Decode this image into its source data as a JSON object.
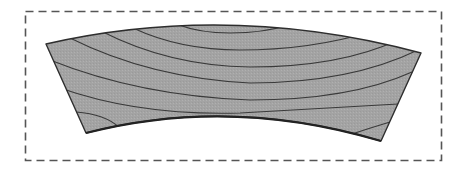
{
  "diagram": {
    "colors": {
      "background": "#ffffff",
      "frame": "#555555",
      "board_fill": "#a3a3a3",
      "board_outline": "#2e2e2e",
      "ring_line": "#3a3a3a"
    },
    "frame": {
      "style": "dashed",
      "x": 25,
      "y": 11,
      "width": 416,
      "height": 149
    },
    "board": {
      "corners": {
        "top_left": [
          46,
          44
        ],
        "top_right": [
          421,
          53
        ],
        "bottom_right": [
          381,
          141
        ],
        "bottom_left": [
          86,
          133
        ]
      },
      "ring_count": 7
    }
  }
}
